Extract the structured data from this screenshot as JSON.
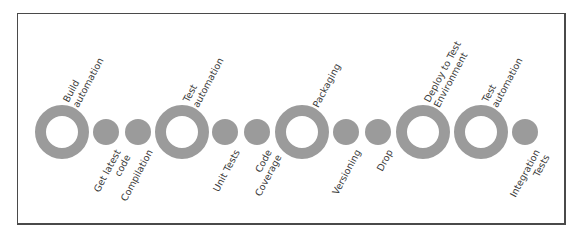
{
  "diagram": {
    "title": "",
    "colors": {
      "node": "#9b9b9b",
      "ring_inner": "#ffffff",
      "text": "#3a3a3a",
      "border": "#4a4a4a"
    },
    "center_y": 132,
    "nodes": [
      {
        "id": "build-automation",
        "kind": "ring",
        "x": 62,
        "label_pos": "top",
        "lines": [
          "Build",
          "automation"
        ]
      },
      {
        "id": "get-latest-code",
        "kind": "dot",
        "x": 106,
        "label_pos": "bottom",
        "lines": [
          "Get latest",
          "code"
        ]
      },
      {
        "id": "compilation",
        "kind": "dot",
        "x": 138,
        "label_pos": "bottom",
        "lines": [
          "Compilation"
        ]
      },
      {
        "id": "test-automation-1",
        "kind": "ring",
        "x": 182,
        "label_pos": "top",
        "lines": [
          "Test",
          "automation"
        ]
      },
      {
        "id": "unit-tests",
        "kind": "dot",
        "x": 225,
        "label_pos": "bottom",
        "lines": [
          "Unit Tests"
        ]
      },
      {
        "id": "code-coverage",
        "kind": "dot",
        "x": 257,
        "label_pos": "bottom",
        "lines": [
          "Code",
          "Coverage"
        ]
      },
      {
        "id": "packaging",
        "kind": "ring",
        "x": 302,
        "label_pos": "top",
        "lines": [
          "Packaging"
        ]
      },
      {
        "id": "versioning",
        "kind": "dot",
        "x": 346,
        "label_pos": "bottom",
        "lines": [
          "Versioning"
        ]
      },
      {
        "id": "drop",
        "kind": "dot",
        "x": 378,
        "label_pos": "bottom",
        "lines": [
          "Drop"
        ]
      },
      {
        "id": "deploy-to-test-environment",
        "kind": "ring",
        "x": 423,
        "label_pos": "top",
        "lines": [
          "Deploy to Test",
          "Environment"
        ]
      },
      {
        "id": "test-automation-2",
        "kind": "ring",
        "x": 481,
        "label_pos": "top",
        "lines": [
          "Test",
          "automation"
        ]
      },
      {
        "id": "integration-tests",
        "kind": "dot",
        "x": 525,
        "label_pos": "bottom",
        "lines": [
          "Integration",
          "Tests"
        ]
      }
    ]
  }
}
